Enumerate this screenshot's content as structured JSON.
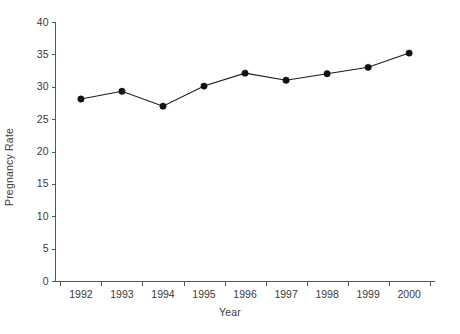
{
  "chart_data": {
    "type": "line",
    "title": "",
    "subtitle": "",
    "xlabel": "Year",
    "ylabel": "Pregnancy Rate",
    "categories": [
      "1992",
      "1993",
      "1994",
      "1995",
      "1996",
      "1997",
      "1998",
      "1999",
      "2000"
    ],
    "x": [
      1992,
      1993,
      1994,
      1995,
      1996,
      1997,
      1998,
      1999,
      2000
    ],
    "values": [
      28.1,
      29.3,
      27.0,
      30.1,
      32.1,
      31.0,
      32.0,
      33.0,
      35.2
    ],
    "series": [
      {
        "name": "Pregnancy Rate",
        "values": [
          28.1,
          29.3,
          27.0,
          30.1,
          32.1,
          31.0,
          32.0,
          33.0,
          35.2
        ]
      }
    ],
    "ylim": [
      0,
      40
    ],
    "ytick_labels": [
      "0",
      "5",
      "10",
      "15",
      "20",
      "25",
      "30",
      "35",
      "40"
    ],
    "yticks": [
      0,
      5,
      10,
      15,
      20,
      25,
      30,
      35,
      40
    ],
    "xtick_labels": [
      "1992",
      "1993",
      "1994",
      "1995",
      "1996",
      "1997",
      "1998",
      "1999",
      "2000"
    ],
    "grid": false,
    "legend": false,
    "legend_position": "none",
    "marker": "filled-circle",
    "line_color": "#1a1a1a",
    "marker_color": "#111111",
    "axis_color": "#555555",
    "text_color": "#3a3a3a",
    "background_color": "#ffffff"
  }
}
